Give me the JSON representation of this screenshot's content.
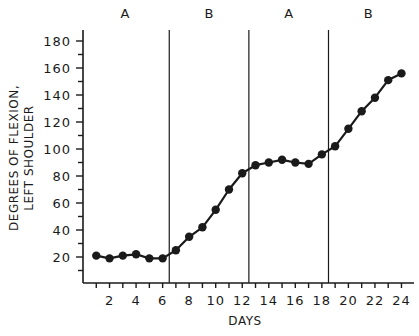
{
  "chart_data": {
    "type": "line",
    "title": "",
    "xlabel": "DAYS",
    "ylabel": [
      "DEGREES OF FLEXION,",
      "LEFT SHOULDER"
    ],
    "x": [
      1,
      2,
      3,
      4,
      5,
      6,
      7,
      8,
      9,
      10,
      11,
      12,
      13,
      14,
      15,
      16,
      17,
      18,
      19,
      20,
      21,
      22,
      23,
      24
    ],
    "series": [
      {
        "name": "Degrees of flexion",
        "values": [
          21,
          19,
          21,
          22,
          19,
          19,
          25,
          35,
          42,
          55,
          70,
          82,
          88,
          90,
          92,
          90,
          89,
          96,
          102,
          115,
          128,
          138,
          151,
          156
        ]
      }
    ],
    "x_tick_labels": [
      "2",
      "4",
      "6",
      "8",
      "10",
      "12",
      "14",
      "16",
      "18",
      "20",
      "22",
      "24"
    ],
    "x_tick_values": [
      2,
      4,
      6,
      8,
      10,
      12,
      14,
      16,
      18,
      20,
      22,
      24
    ],
    "y_tick_labels": [
      "20",
      "40",
      "60",
      "80",
      "100",
      "120",
      "140",
      "160",
      "180"
    ],
    "y_tick_values": [
      20,
      40,
      60,
      80,
      100,
      120,
      140,
      160,
      180
    ],
    "xlim": [
      0,
      25
    ],
    "ylim": [
      10,
      180
    ],
    "grid": false,
    "legend": null,
    "phases": [
      {
        "label": "A",
        "start": 0.5,
        "end": 6.5
      },
      {
        "label": "B",
        "start": 6.5,
        "end": 12.5
      },
      {
        "label": "A",
        "start": 12.5,
        "end": 18.5
      },
      {
        "label": "B",
        "start": 18.5,
        "end": 24.5
      }
    ],
    "phase_change_lines": [
      6.5,
      12.5,
      18.5
    ]
  }
}
